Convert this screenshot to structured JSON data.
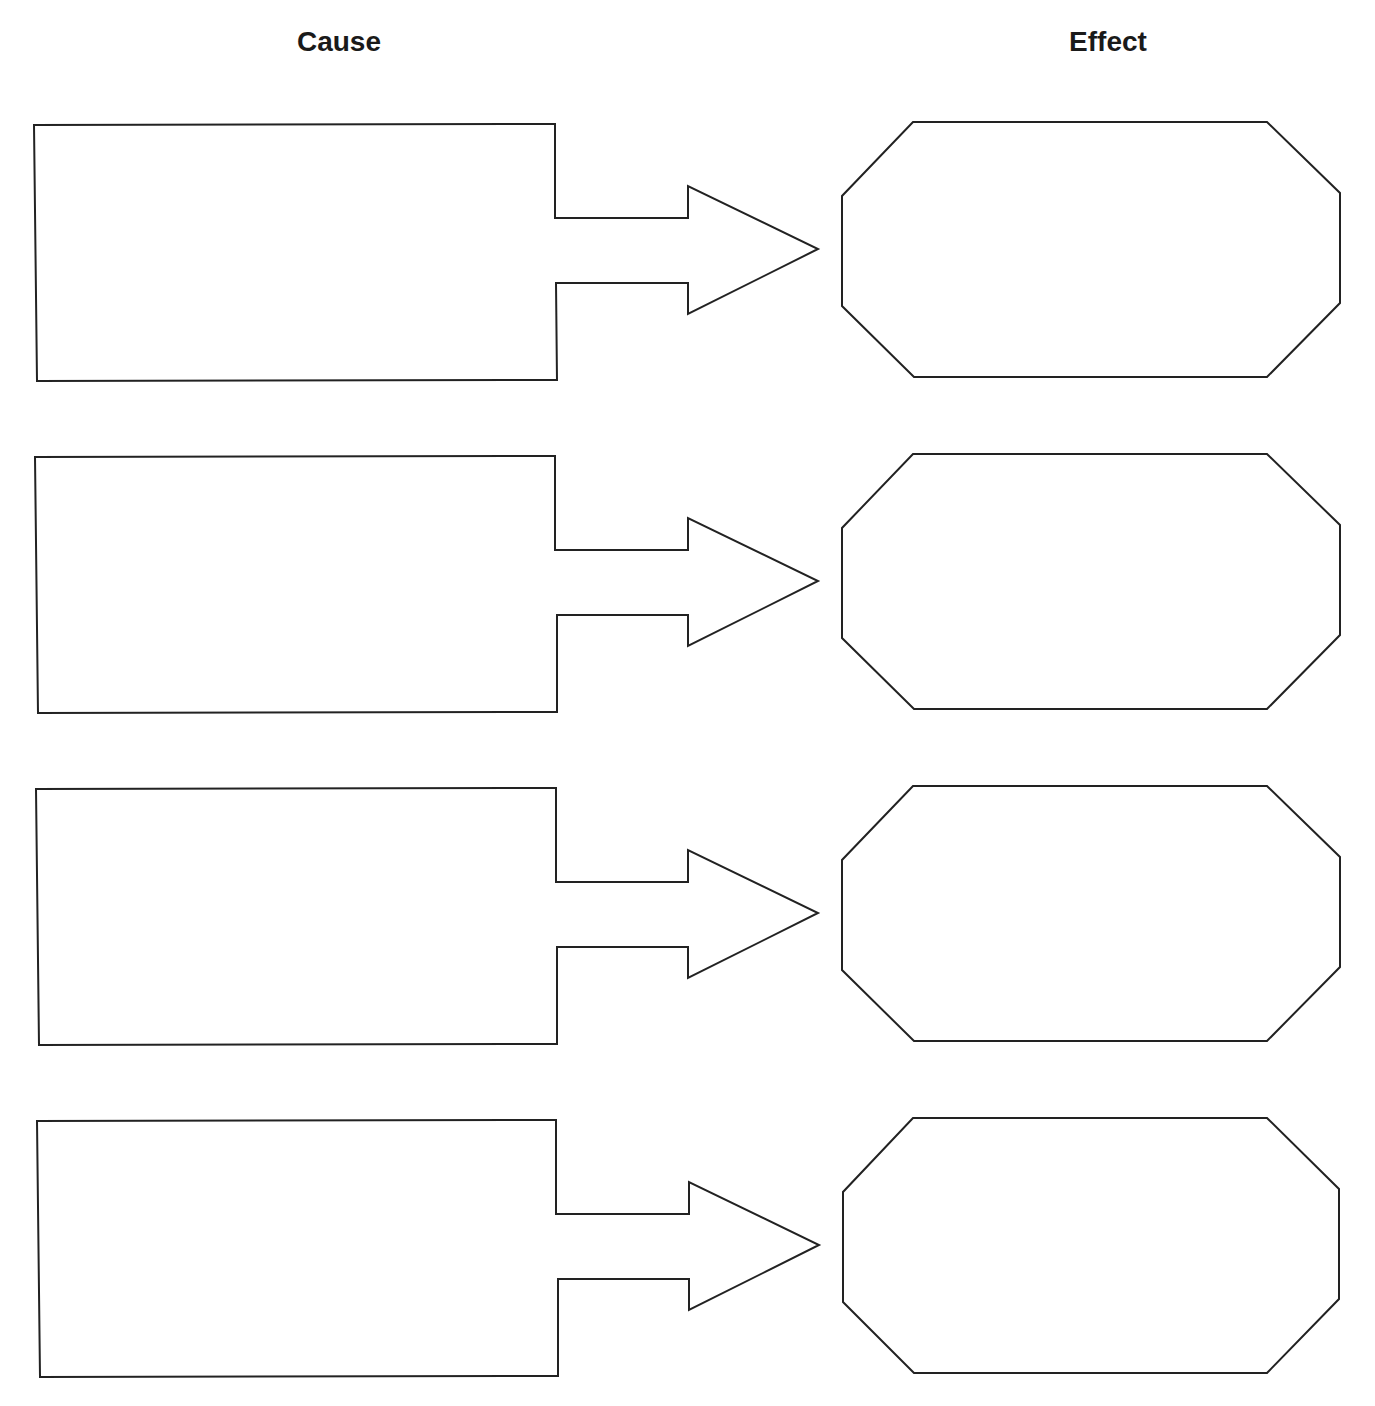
{
  "headings": {
    "cause": "Cause",
    "effect": "Effect"
  },
  "colors": {
    "stroke": "#222222",
    "background": "#ffffff",
    "text": "#1a1a1a"
  },
  "rows": [
    {
      "cause": "",
      "effect": ""
    },
    {
      "cause": "",
      "effect": ""
    },
    {
      "cause": "",
      "effect": ""
    },
    {
      "cause": "",
      "effect": ""
    }
  ]
}
